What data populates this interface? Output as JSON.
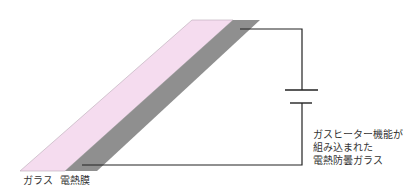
{
  "labels": {
    "glass": "ガラス",
    "heating_film": "電熱膜",
    "description_lines": [
      "ガスヒーター機能が",
      "組み込まれた",
      "電熱防曇ガラス"
    ]
  },
  "colors": {
    "glass_fill": "#f5dcef",
    "glass_stroke": "#b9aab5",
    "film_fill": "#8f8f8f",
    "wire": "#222222"
  }
}
